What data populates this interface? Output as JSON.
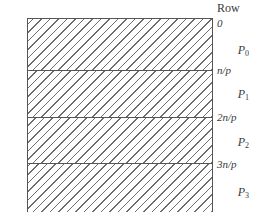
{
  "figure": {
    "row_heading": "Row",
    "process_labels": [
      {
        "name": "P",
        "subscript": "0"
      },
      {
        "name": "P",
        "subscript": "1"
      },
      {
        "name": "P",
        "subscript": "2"
      },
      {
        "name": "P",
        "subscript": "3"
      }
    ],
    "row_ticks": [
      "0",
      "n/p",
      "2n/p",
      "3n/p"
    ],
    "bands": [
      {
        "label": "P0",
        "hatch": "diagonal-backslash"
      },
      {
        "label": "P1",
        "hatch": "diagonal-backslash"
      },
      {
        "label": "P2",
        "hatch": "diagonal-backslash"
      },
      {
        "label": "P3",
        "hatch": "diagonal-backslash"
      }
    ],
    "colors": {
      "border": "#555555",
      "hatch": "#6d6d6d",
      "background": "#ffffff",
      "text": "#3a3a3a"
    }
  }
}
